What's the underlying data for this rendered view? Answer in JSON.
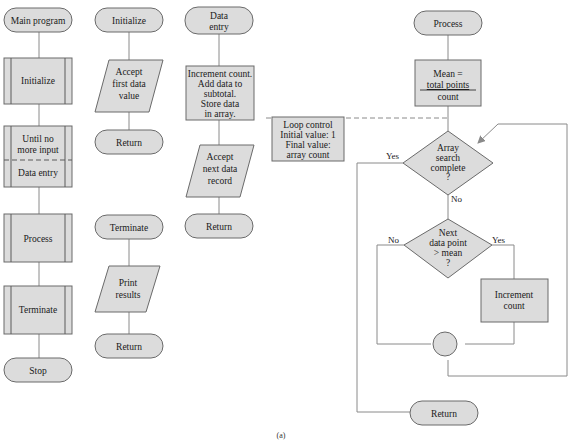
{
  "diagram": {
    "caption": "(a)",
    "main": {
      "start": "Main program",
      "initialize": "Initialize",
      "loop_condition": [
        "Until no",
        "more input"
      ],
      "data_entry": "Data entry",
      "process": "Process",
      "terminate": "Terminate",
      "stop": "Stop"
    },
    "initialize_module": {
      "start": "Initialize",
      "io": [
        "Accept",
        "first data",
        "value"
      ],
      "end": "Return"
    },
    "terminate_module": {
      "start": "Terminate",
      "io": [
        "Print",
        "results"
      ],
      "end": "Return"
    },
    "data_entry_module": {
      "start": [
        "Data",
        "entry"
      ],
      "process": [
        "Increment count.",
        "Add data to",
        "subtotal.",
        "Store data",
        "in array."
      ],
      "io": [
        "Accept",
        "next data",
        "record"
      ],
      "end": "Return"
    },
    "process_module": {
      "start": "Process",
      "mean_box": {
        "line1": "Mean =",
        "numerator": "total points",
        "denominator": "count"
      },
      "loop_control": [
        "Loop control",
        "Initial value:  1",
        "Final value:",
        "array count"
      ],
      "decision1": [
        "Array",
        "search",
        "complete",
        "?"
      ],
      "decision1_yes": "Yes",
      "decision1_no": "No",
      "decision2": [
        "Next",
        "data point",
        "> mean",
        "?"
      ],
      "decision2_yes": "Yes",
      "decision2_no": "No",
      "increment": [
        "Increment",
        "count"
      ],
      "end": "Return"
    },
    "colors": {
      "fill": "#dcdcdc",
      "stroke": "#6a6a6a",
      "connector": "#8a8a8a"
    }
  }
}
